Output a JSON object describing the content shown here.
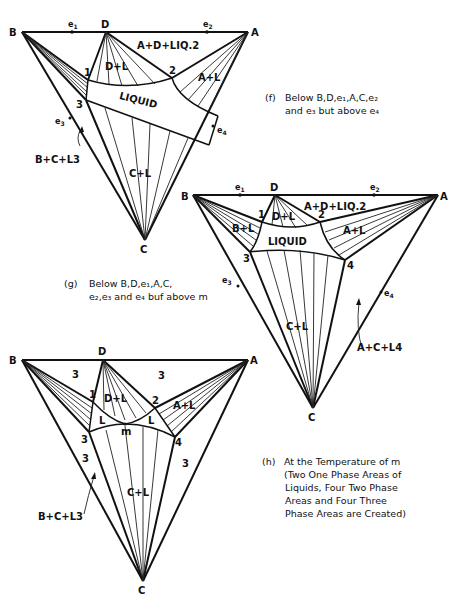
{
  "figure": {
    "panels": [
      {
        "id": "f",
        "vertices": {
          "B": "B",
          "D": "D",
          "A": "A",
          "C": "C"
        },
        "eutectics": {
          "e1": "e",
          "e1_sub": "1",
          "e2": "e",
          "e2_sub": "2",
          "e3": "e",
          "e3_sub": "3",
          "e4": "e",
          "e4_sub": "4"
        },
        "points": {
          "p1": "1",
          "p2": "2",
          "p3": "3"
        },
        "regions": {
          "top": "A+D+LIQ.2",
          "dl": "D+L",
          "al": "A+L",
          "liquid": "LIQUID",
          "cl": "C+L",
          "bcl3": "B+C+L3"
        },
        "caption_label": "(f)",
        "caption_lines": [
          "Below B,D,e₁,A,C,e₂",
          "and e₃ but above e₄"
        ]
      },
      {
        "id": "g",
        "vertices": {
          "B": "B",
          "D": "D",
          "A": "A",
          "C": "C"
        },
        "eutectics": {
          "e1": "e",
          "e1_sub": "1",
          "e2": "e",
          "e2_sub": "2",
          "e3": "e",
          "e3_sub": "3",
          "e4": "e",
          "e4_sub": "4"
        },
        "points": {
          "p1": "1",
          "p2": "2",
          "p3": "3",
          "p4": "4"
        },
        "regions": {
          "top": "A+D+LIQ.2",
          "dl": "D+L",
          "bl": "B+L",
          "al": "A+L",
          "liquid": "LIQUID",
          "cl": "C+L",
          "acl4": "A+C+L4"
        },
        "caption_label": "(g)",
        "caption_lines": [
          "Below B,D,e₁,A,C,",
          "e₂,e₃ and e₄ buf above m"
        ]
      },
      {
        "id": "h",
        "vertices": {
          "B": "B",
          "D": "D",
          "A": "A",
          "C": "C"
        },
        "points": {
          "p1": "1",
          "p2": "2",
          "p3": "3",
          "p4": "4",
          "m": "m"
        },
        "regions": {
          "three_tl": "3",
          "three_tr": "3",
          "three_bl": "3",
          "three_br": "3",
          "dl": "D+L",
          "al": "A+L",
          "l_left": "L",
          "l_right": "L",
          "cl": "C+L",
          "bcl3": "B+C+L3"
        },
        "caption_label": "(h)",
        "caption_lines": [
          "At the Temperature of m",
          "(Two One Phase Areas of",
          "Liquids, Four Two Phase",
          "Areas and Four Three",
          "Phase Areas are Created)"
        ]
      }
    ]
  }
}
